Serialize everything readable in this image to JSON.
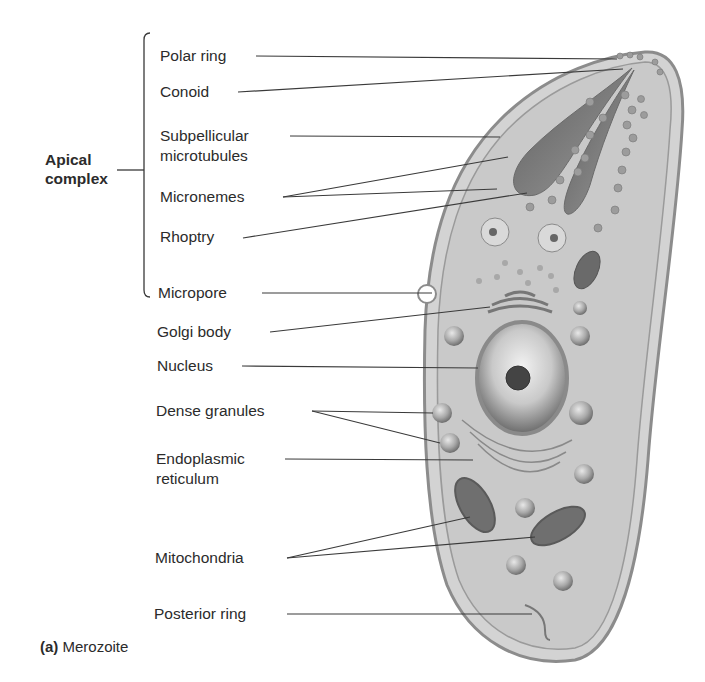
{
  "figure": {
    "caption_letter": "(a)",
    "caption_text": "Merozoite",
    "group_label_line1": "Apical",
    "group_label_line2": "complex",
    "labels": [
      {
        "id": "polar-ring",
        "text": "Polar ring"
      },
      {
        "id": "conoid",
        "text": "Conoid"
      },
      {
        "id": "subpellicular-1",
        "text": "Subpellicular"
      },
      {
        "id": "subpellicular-2",
        "text": "microtubules"
      },
      {
        "id": "micronemes",
        "text": "Micronemes"
      },
      {
        "id": "rhoptry",
        "text": "Rhoptry"
      },
      {
        "id": "micropore",
        "text": "Micropore"
      },
      {
        "id": "golgi",
        "text": "Golgi body"
      },
      {
        "id": "nucleus",
        "text": "Nucleus"
      },
      {
        "id": "dense-granules",
        "text": "Dense granules"
      },
      {
        "id": "er-1",
        "text": "Endoplasmic"
      },
      {
        "id": "er-2",
        "text": "reticulum"
      },
      {
        "id": "mitochondria",
        "text": "Mitochondria"
      },
      {
        "id": "posterior-ring",
        "text": "Posterior ring"
      }
    ]
  },
  "colors": {
    "cell_fill": "#cfcfcf",
    "membrane": "#8a8a8a",
    "organelle_dark": "#6e6e6e",
    "leader_line": "#3a3a3a",
    "text": "#2b2b2b"
  }
}
